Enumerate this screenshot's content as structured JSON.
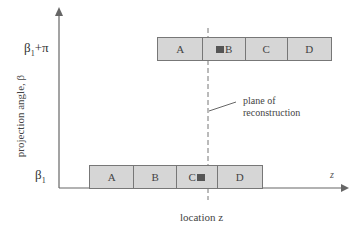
{
  "diagram": {
    "y_axis_label": "projection angle, β",
    "x_axis_label": "location z",
    "x_axis_end_label": "z",
    "y_ticks": [
      {
        "label": "β₁+π",
        "base": "β",
        "sub": "1",
        "suffix": "+π"
      },
      {
        "label": "β₁",
        "base": "β",
        "sub": "1",
        "suffix": ""
      }
    ],
    "top_bar": {
      "cells": [
        "A",
        "B",
        "C",
        "D"
      ]
    },
    "bottom_bar": {
      "cells": [
        "A",
        "B",
        "C",
        "D"
      ]
    },
    "annotation": {
      "line1": "plane of",
      "line2": "reconstruction"
    },
    "colors": {
      "bar_fill": "#d6d6d6",
      "line": "#666666",
      "marker": "#555555"
    }
  }
}
